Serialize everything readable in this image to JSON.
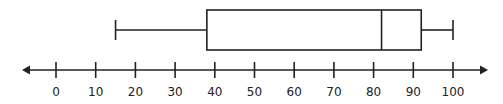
{
  "chart_data": {
    "type": "boxplot",
    "title": "",
    "xlabel": "",
    "ylabel": "",
    "orientation": "horizontal",
    "axis": {
      "min": 0,
      "max": 100,
      "ticks": [
        0,
        10,
        20,
        30,
        40,
        50,
        60,
        70,
        80,
        90,
        100
      ],
      "tick_labels": [
        "0",
        "10",
        "20",
        "30",
        "40",
        "50",
        "60",
        "70",
        "80",
        "90",
        "100"
      ],
      "arrows_both_ends": true
    },
    "box": {
      "min": 15,
      "q1": 38,
      "median": 82,
      "q3": 92,
      "max": 100
    },
    "grid": false,
    "legend": null
  },
  "colors": {
    "stroke": "#222222",
    "background": "#ffffff"
  }
}
